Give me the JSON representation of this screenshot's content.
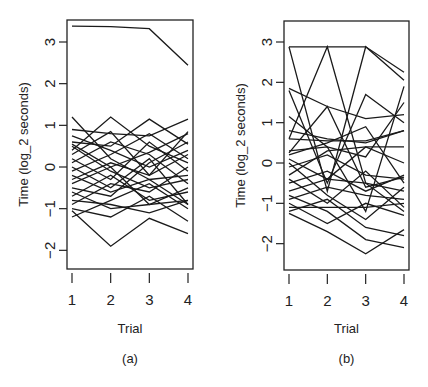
{
  "chart_data": [
    {
      "type": "line",
      "panel_label": "(a)",
      "title": "",
      "xlabel": "Trial",
      "ylabel": "Time (log_2 seconds)",
      "x": [
        1,
        2,
        3,
        4
      ],
      "x_ticks": [
        "1",
        "2",
        "3",
        "4"
      ],
      "y_ticks": [
        "3",
        "2",
        "1",
        "0",
        "−1",
        "−2"
      ],
      "y_tick_values": [
        3,
        2,
        1,
        0,
        -1,
        -2
      ],
      "ylim": [
        -2.45,
        3.5
      ],
      "xlim": [
        0.85,
        4.15
      ],
      "grid": false,
      "legend": null,
      "series": [
        {
          "name": "s1",
          "values": [
            3.38,
            3.37,
            3.32,
            2.44
          ]
        },
        {
          "name": "s2",
          "values": [
            1.2,
            0.2,
            -0.3,
            -0.9
          ]
        },
        {
          "name": "s3",
          "values": [
            0.4,
            1.2,
            0.5,
            0.1
          ]
        },
        {
          "name": "s4",
          "values": [
            0.9,
            0.8,
            0.75,
            1.15
          ]
        },
        {
          "name": "s5",
          "values": [
            0.6,
            0.5,
            1.15,
            0.55
          ]
        },
        {
          "name": "s6",
          "values": [
            0.3,
            0.85,
            -0.2,
            0.85
          ]
        },
        {
          "name": "s7",
          "values": [
            0.1,
            0.6,
            0.3,
            -0.4
          ]
        },
        {
          "name": "s8",
          "values": [
            -0.1,
            0.3,
            0.8,
            0.2
          ]
        },
        {
          "name": "s9",
          "values": [
            0.2,
            -0.3,
            0.6,
            -0.1
          ]
        },
        {
          "name": "s10",
          "values": [
            -0.3,
            0.1,
            -0.2,
            0.3
          ]
        },
        {
          "name": "s11",
          "values": [
            0.5,
            -0.1,
            -0.5,
            -0.3
          ]
        },
        {
          "name": "s12",
          "values": [
            -0.5,
            -0.7,
            0.1,
            0.6
          ]
        },
        {
          "name": "s13",
          "values": [
            -0.7,
            -0.2,
            -0.8,
            -0.6
          ]
        },
        {
          "name": "s14",
          "values": [
            0.0,
            -0.5,
            0.2,
            -0.9
          ]
        },
        {
          "name": "s15",
          "values": [
            -0.9,
            -0.4,
            -0.6,
            0.0
          ]
        },
        {
          "name": "s16",
          "values": [
            -1.2,
            -0.8,
            -0.4,
            -1.0
          ]
        },
        {
          "name": "s17",
          "values": [
            -0.6,
            -1.0,
            -0.9,
            -0.5
          ]
        },
        {
          "name": "s18",
          "values": [
            -1.0,
            -1.2,
            -0.7,
            -1.3
          ]
        },
        {
          "name": "s19",
          "values": [
            -0.8,
            -0.9,
            -1.1,
            -0.8
          ]
        },
        {
          "name": "s20",
          "values": [
            -1.05,
            -1.9,
            -1.23,
            -1.6
          ]
        },
        {
          "name": "s21",
          "values": [
            0.75,
            0.4,
            0.0,
            0.4
          ]
        },
        {
          "name": "s22",
          "values": [
            -0.2,
            -0.6,
            -0.3,
            -0.2
          ]
        },
        {
          "name": "s23",
          "values": [
            0.55,
            0.0,
            -0.9,
            -0.8
          ]
        },
        {
          "name": "s24",
          "values": [
            -0.4,
            0.0,
            0.35,
            0.8
          ]
        }
      ]
    },
    {
      "type": "line",
      "panel_label": "(b)",
      "title": "",
      "xlabel": "Trial",
      "ylabel": "Time (log_2 seconds)",
      "x": [
        1,
        2,
        3,
        4
      ],
      "x_ticks": [
        "1",
        "2",
        "3",
        "4"
      ],
      "y_ticks": [
        "3",
        "2",
        "1",
        "0",
        "−1",
        "−2"
      ],
      "y_tick_values": [
        3,
        2,
        1,
        0,
        -1,
        -2
      ],
      "ylim": [
        -2.45,
        3.5
      ],
      "xlim": [
        0.85,
        4.15
      ],
      "grid": false,
      "legend": null,
      "series": [
        {
          "name": "s1",
          "values": [
            2.88,
            2.88,
            2.88,
            2.25
          ]
        },
        {
          "name": "s2",
          "values": [
            2.88,
            -0.7,
            2.88,
            2.05
          ]
        },
        {
          "name": "s3",
          "values": [
            0.6,
            2.88,
            -0.5,
            -1.2
          ]
        },
        {
          "name": "s4",
          "values": [
            1.85,
            1.4,
            1.1,
            1.2
          ]
        },
        {
          "name": "s5",
          "values": [
            1.8,
            -0.5,
            1.7,
            1.0
          ]
        },
        {
          "name": "s6",
          "values": [
            1.15,
            0.4,
            -1.2,
            1.9
          ]
        },
        {
          "name": "s7",
          "values": [
            0.8,
            0.6,
            0.5,
            0.8
          ]
        },
        {
          "name": "s8",
          "values": [
            0.6,
            0.55,
            0.55,
            0.8
          ]
        },
        {
          "name": "s9",
          "values": [
            0.3,
            0.4,
            0.15,
            1.5
          ]
        },
        {
          "name": "s10",
          "values": [
            0.25,
            1.4,
            -0.6,
            -0.35
          ]
        },
        {
          "name": "s11",
          "values": [
            0.1,
            -0.4,
            0.4,
            0.4
          ]
        },
        {
          "name": "s12",
          "values": [
            -0.1,
            0.2,
            -0.3,
            -0.4
          ]
        },
        {
          "name": "s13",
          "values": [
            -0.3,
            0.3,
            0.4,
            0.0
          ]
        },
        {
          "name": "s14",
          "values": [
            -0.5,
            -0.2,
            -0.7,
            -0.3
          ]
        },
        {
          "name": "s15",
          "values": [
            -0.7,
            -0.4,
            -0.5,
            -0.7
          ]
        },
        {
          "name": "s16",
          "values": [
            -0.9,
            -0.6,
            -0.8,
            -0.9
          ]
        },
        {
          "name": "s17",
          "values": [
            -1.0,
            -1.5,
            -1.0,
            -1.3
          ]
        },
        {
          "name": "s18",
          "values": [
            -1.1,
            -1.1,
            -1.1,
            -1.0
          ]
        },
        {
          "name": "s19",
          "values": [
            -1.25,
            -1.7,
            -2.25,
            -1.65
          ]
        },
        {
          "name": "s20",
          "values": [
            -0.8,
            -1.2,
            -1.9,
            -2.1
          ]
        },
        {
          "name": "s21",
          "values": [
            -1.2,
            -0.9,
            -1.6,
            -1.8
          ]
        },
        {
          "name": "s22",
          "values": [
            0.0,
            -0.8,
            -1.4,
            -0.6
          ]
        },
        {
          "name": "s23",
          "values": [
            -0.4,
            -1.0,
            -0.2,
            -1.1
          ]
        },
        {
          "name": "s24",
          "values": [
            0.2,
            0.5,
            0.9,
            -0.5
          ]
        }
      ]
    }
  ]
}
